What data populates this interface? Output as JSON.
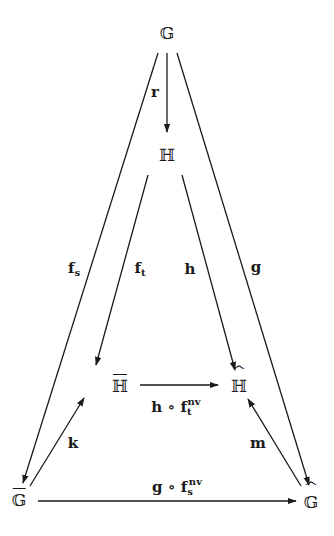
{
  "nodes": {
    "G": {
      "symbol": "𝔾",
      "decoration": "none",
      "x": 167,
      "y": 33
    },
    "H": {
      "symbol": "ℍ",
      "decoration": "none",
      "x": 167,
      "y": 155
    },
    "H_bar": {
      "symbol": "ℍ",
      "decoration": "bar",
      "x": 120,
      "y": 386
    },
    "H_hat": {
      "symbol": "ℍ",
      "decoration": "hat",
      "x": 239,
      "y": 386
    },
    "G_bar": {
      "symbol": "𝔾",
      "decoration": "bar",
      "x": 19,
      "y": 500
    },
    "G_hat": {
      "symbol": "𝔾",
      "decoration": "hat",
      "x": 311,
      "y": 502
    }
  },
  "arrows": [
    {
      "from": "G",
      "to": "H",
      "label": "r",
      "x1": 167,
      "y1": 53,
      "x2": 167,
      "y2": 132
    },
    {
      "from": "G",
      "to": "G_bar",
      "label": "f_s",
      "x1": 158,
      "y1": 53,
      "x2": 23,
      "y2": 483
    },
    {
      "from": "H",
      "to": "H_bar",
      "label": "f_t",
      "x1": 148,
      "y1": 175,
      "x2": 96,
      "y2": 365
    },
    {
      "from": "H",
      "to": "H_hat",
      "label": "h",
      "x1": 182,
      "y1": 175,
      "x2": 235,
      "y2": 370
    },
    {
      "from": "G",
      "to": "G_hat",
      "label": "g",
      "x1": 177,
      "y1": 53,
      "x2": 309,
      "y2": 485
    },
    {
      "from": "H_bar",
      "to": "H_hat",
      "label": "h ∘ f_t^nv",
      "x1": 140,
      "y1": 385,
      "x2": 218,
      "y2": 385
    },
    {
      "from": "G_bar",
      "to": "H_bar",
      "label": "k",
      "x1": 30,
      "y1": 486,
      "x2": 84,
      "y2": 398
    },
    {
      "from": "G_hat",
      "to": "H_hat",
      "label": "m",
      "x1": 301,
      "y1": 486,
      "x2": 248,
      "y2": 399
    },
    {
      "from": "G_bar",
      "to": "G_hat",
      "label": "g ∘ f_s^nv",
      "x1": 38,
      "y1": 501,
      "x2": 296,
      "y2": 501
    }
  ],
  "labels": {
    "r": {
      "base": "r",
      "sub": "",
      "sup": "",
      "x": 155,
      "y": 92
    },
    "f_s": {
      "base": "f",
      "sub": "s",
      "sup": "",
      "x": 74,
      "y": 268
    },
    "f_t": {
      "base": "f",
      "sub": "t",
      "sup": "",
      "x": 140,
      "y": 268
    },
    "h": {
      "base": "h",
      "sub": "",
      "sup": "",
      "x": 190,
      "y": 269
    },
    "g": {
      "base": "g",
      "sub": "",
      "sup": "",
      "x": 256,
      "y": 267
    },
    "h_f_t_nv": {
      "base": "h ∘ f",
      "sub": "t",
      "sup": "nv",
      "x": 176,
      "y": 406
    },
    "k": {
      "base": "k",
      "sub": "",
      "sup": "",
      "x": 73,
      "y": 443
    },
    "m": {
      "base": "m",
      "sub": "",
      "sup": "",
      "x": 258,
      "y": 443
    },
    "g_f_s_nv": {
      "base": "g ∘ f",
      "sub": "s",
      "sup": "nv",
      "x": 177,
      "y": 486
    }
  },
  "colors": {
    "ink": "#1a1a1a",
    "background": "#ffffff"
  }
}
